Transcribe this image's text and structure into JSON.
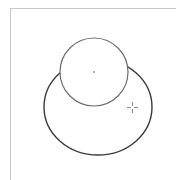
{
  "canvas": {
    "label": "Drawing canvas",
    "background": "#ffffff",
    "border_color": "#c8c8c8"
  },
  "shapes": [
    {
      "type": "ellipse",
      "label": "Large ellipse",
      "cx": 98,
      "cy": 107,
      "rx": 54,
      "ry": 48,
      "stroke": "#3a3a3a",
      "fill": "none"
    },
    {
      "type": "circle",
      "label": "Small circle",
      "cx": 94,
      "cy": 72,
      "r": 34,
      "stroke": "#6e6e6e",
      "fill": "#ffffff",
      "center_marker": true
    }
  ],
  "cursor": {
    "type": "crosshair",
    "label": "Crosshair cursor",
    "x": 132,
    "y": 107,
    "color": "#8a8a8a"
  }
}
